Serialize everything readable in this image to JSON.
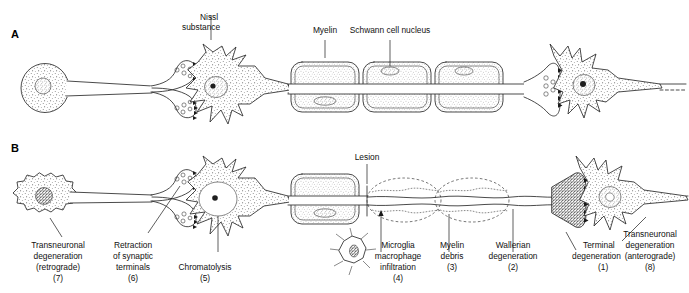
{
  "figure": {
    "title_visible": false,
    "background_color": "#ffffff",
    "ink_color": "#2b2b2b",
    "panels": [
      {
        "letter": "A",
        "name": "normal-neuron-chain",
        "description_visible": false,
        "labels": [
          {
            "id": "nissl",
            "text_lines": [
              "Nissl",
              "substance"
            ],
            "number": ""
          },
          {
            "id": "myelin",
            "text_lines": [
              "Myelin"
            ],
            "number": ""
          },
          {
            "id": "schwann",
            "text_lines": [
              "Schwann cell nucleus"
            ],
            "number": ""
          }
        ]
      },
      {
        "letter": "B",
        "name": "degenerating-neuron-chain",
        "description_visible": false,
        "labels": [
          {
            "id": "lesion",
            "text_lines": [
              "Lesion"
            ],
            "number": ""
          },
          {
            "id": "transneuronal-retrograde",
            "text_lines": [
              "Transneuronal",
              "degeneration",
              "(retrograde)"
            ],
            "number": "(7)"
          },
          {
            "id": "retraction",
            "text_lines": [
              "Retraction",
              "of synaptic",
              "terminals"
            ],
            "number": "(6)"
          },
          {
            "id": "chromatolysis",
            "text_lines": [
              "Chromatolysis"
            ],
            "number": "(5)"
          },
          {
            "id": "microglia",
            "text_lines": [
              "Microglia",
              "macrophage",
              "infiltration"
            ],
            "number": "(4)"
          },
          {
            "id": "myelin-debris",
            "text_lines": [
              "Myelin",
              "debris"
            ],
            "number": "(3)"
          },
          {
            "id": "wallerian",
            "text_lines": [
              "Wallerian",
              "degeneration"
            ],
            "number": "(2)"
          },
          {
            "id": "terminal",
            "text_lines": [
              "Terminal",
              "degeneration"
            ],
            "number": "(1)"
          },
          {
            "id": "transneuronal-anterograde",
            "text_lines": [
              "Transneuronal",
              "degeneration",
              "(anterograde)"
            ],
            "number": "(8)"
          }
        ]
      }
    ]
  },
  "panelA": {
    "letter": "A",
    "label_nissl_line1": "Nissl",
    "label_nissl_line2": "substance",
    "label_myelin": "Myelin",
    "label_schwann": "Schwann cell nucleus"
  },
  "panelB": {
    "letter": "B",
    "label_lesion": "Lesion",
    "transneuronal_retro_line1": "Transneuronal",
    "transneuronal_retro_line2": "degeneration",
    "transneuronal_retro_line3": "(retrograde)",
    "transneuronal_retro_num": "(7)",
    "retraction_line1": "Retraction",
    "retraction_line2": "of synaptic",
    "retraction_line3": "terminals",
    "retraction_num": "(6)",
    "chromatolysis_line1": "Chromatolysis",
    "chromatolysis_num": "(5)",
    "microglia_line1": "Microglia",
    "microglia_line2": "macrophage",
    "microglia_line3": "infiltration",
    "microglia_num": "(4)",
    "myelin_debris_line1": "Myelin",
    "myelin_debris_line2": "debris",
    "myelin_debris_num": "(3)",
    "wallerian_line1": "Wallerian",
    "wallerian_line2": "degeneration",
    "wallerian_num": "(2)",
    "terminal_line1": "Terminal",
    "terminal_line2": "degeneration",
    "terminal_num": "(1)",
    "transneuronal_antero_line1": "Transneuronal",
    "transneuronal_antero_line2": "degeneration",
    "transneuronal_antero_line3": "(anterograde)",
    "transneuronal_antero_num": "(8)"
  }
}
